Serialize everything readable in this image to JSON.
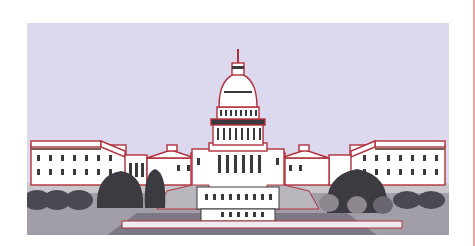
{
  "image": {
    "subject": "Illustration of the United States Capitol building",
    "colors": {
      "sky": "#dcd9ee",
      "outline": "#b0303c",
      "building": "#ffffff",
      "window": "#3a3a3e",
      "tree_dark": "#3c3b42",
      "tree_mid": "#6a6670",
      "tree_light": "#8e8790",
      "hedge": "#4a4850",
      "ground_light": "#c9c6cc",
      "ground_mid": "#9e9aa4",
      "ground_dark": "#7d7884",
      "plaza": "#ecebef",
      "steps": "#b9b6bd",
      "page_rule": "#e29a94"
    }
  }
}
